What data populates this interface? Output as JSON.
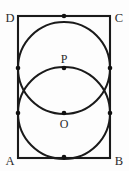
{
  "figure": {
    "canvas": {
      "width": 129,
      "height": 171,
      "background": "#fdfdfd"
    },
    "stroke_color": "#1a1a1a",
    "label_color": "#2b2b2b",
    "rectangle": {
      "name": "ABCD",
      "left": 18,
      "top": 16,
      "right": 110,
      "bottom": 158,
      "width": 92,
      "height": 142,
      "stroke_width": 2.1
    },
    "circles": [
      {
        "id": "circle-P",
        "center_label": "P",
        "cx": 64,
        "cy": 68,
        "r": 46,
        "stroke_width": 2.0,
        "tangent_to": [
          "top",
          "left",
          "right"
        ]
      },
      {
        "id": "circle-O",
        "center_label": "O",
        "cx": 64,
        "cy": 113,
        "r": 46,
        "stroke_width": 2.0,
        "tangent_to": [
          "bottom",
          "left",
          "right"
        ]
      }
    ],
    "vertex_labels": [
      {
        "id": "label-D",
        "text": "D",
        "x": 10,
        "y": 22
      },
      {
        "id": "label-C",
        "text": "C",
        "x": 119,
        "y": 22
      },
      {
        "id": "label-A",
        "text": "A",
        "x": 10,
        "y": 165
      },
      {
        "id": "label-B",
        "text": "B",
        "x": 119,
        "y": 165
      }
    ],
    "center_labels": [
      {
        "id": "label-P",
        "text": "P",
        "x": 64,
        "y": 63
      },
      {
        "id": "label-O",
        "text": "O",
        "x": 64,
        "y": 128
      }
    ],
    "marker_points": [
      {
        "id": "dot-top-tangent",
        "x": 64,
        "y": 16,
        "r": 2.3
      },
      {
        "id": "dot-bottom-tangent",
        "x": 64,
        "y": 157,
        "r": 2.3
      },
      {
        "id": "dot-left-upper",
        "x": 18,
        "y": 68,
        "r": 2.3
      },
      {
        "id": "dot-left-lower",
        "x": 18,
        "y": 113,
        "r": 2.3
      },
      {
        "id": "dot-right-upper",
        "x": 110,
        "y": 68,
        "r": 2.3
      },
      {
        "id": "dot-right-lower",
        "x": 110,
        "y": 113,
        "r": 2.3
      },
      {
        "id": "dot-center-P",
        "x": 64,
        "y": 68,
        "r": 2.3
      },
      {
        "id": "dot-center-O",
        "x": 64,
        "y": 113,
        "r": 2.3
      }
    ]
  }
}
